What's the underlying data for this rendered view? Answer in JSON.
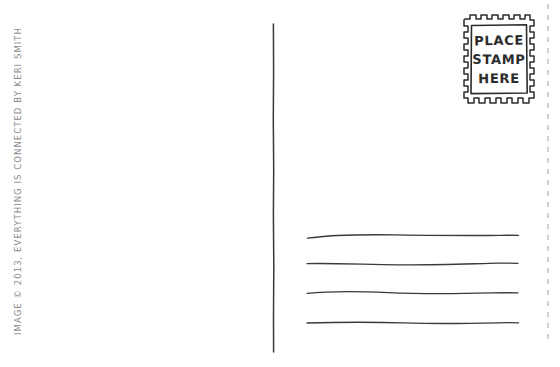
{
  "page": {
    "background_color": "#ffffff",
    "ink_color": "#2b2b2b",
    "credit_color": "#8a8a8a",
    "width": 560,
    "height": 367
  },
  "credit": {
    "text": "IMAGE © 2013, EVERYTHING IS CONNECTED BY KERI SMITH",
    "orientation": "vertical-bottom-to-top"
  },
  "divider": {
    "label": "center-divider",
    "x": 273,
    "y_start": 24,
    "y_end": 352
  },
  "stamp": {
    "label": "place-stamp-here-box",
    "line1": "PLACE",
    "line2": "STAMP",
    "line3": "HERE",
    "border_style": "perforated",
    "x": 464,
    "y": 15,
    "width": 67,
    "height": 88
  },
  "address_lines": {
    "label": "address-writing-lines",
    "count": 4,
    "x_start": 307,
    "x_end": 518,
    "y_positions": [
      236,
      262,
      292,
      322
    ]
  },
  "edge_artifact": {
    "label": "scan-edge-dashes",
    "x": 548,
    "color": "#a0a0a0"
  }
}
